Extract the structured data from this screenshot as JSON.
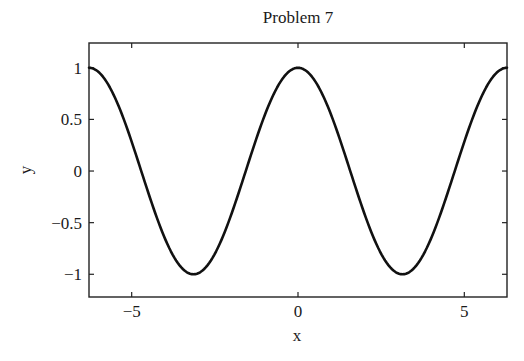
{
  "chart_data": {
    "type": "line",
    "title": "Problem 7",
    "xlabel": "x",
    "ylabel": "y",
    "xlim": [
      -6.2832,
      6.2832
    ],
    "ylim": [
      -1.22,
      1.24
    ],
    "grid": false,
    "legend": null,
    "xticks": [
      -5,
      0,
      5
    ],
    "xtick_labels": [
      "−5",
      "0",
      "5"
    ],
    "yticks": [
      1,
      0.5,
      0,
      -0.5,
      -1
    ],
    "ytick_labels": [
      "1",
      "0.5",
      "0",
      "−0.5",
      "−1"
    ],
    "series": [
      {
        "name": "y = cos(x)",
        "color": "#111111",
        "x": [
          -6.2832,
          -5.7596,
          -5.236,
          -4.7124,
          -4.1888,
          -3.6652,
          -3.1416,
          -2.618,
          -2.0944,
          -1.5708,
          -1.0472,
          -0.5236,
          0.0,
          0.5236,
          1.0472,
          1.5708,
          2.0944,
          2.618,
          3.1416,
          3.6652,
          4.1888,
          4.7124,
          5.236,
          5.7596,
          6.2832
        ],
        "y": [
          1.0,
          0.866,
          0.5,
          0.0,
          -0.5,
          -0.866,
          -1.0,
          -0.866,
          -0.5,
          0.0,
          0.5,
          0.866,
          1.0,
          0.866,
          0.5,
          0.0,
          -0.5,
          -0.866,
          -1.0,
          -0.866,
          -0.5,
          0.0,
          0.5,
          0.866,
          1.0
        ]
      }
    ]
  }
}
